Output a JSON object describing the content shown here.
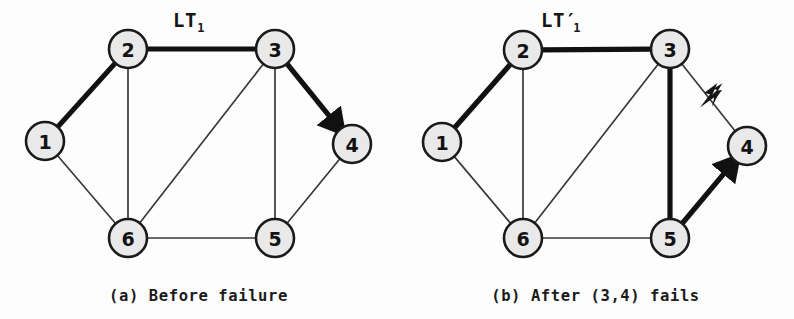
{
  "figure": {
    "background_color": "#fdfdfd",
    "node_fill": "#e9e9e9",
    "node_stroke": "#1a1a1a",
    "edge_thin_color": "#3a3a3a",
    "edge_bold_color": "#111111"
  },
  "panels": [
    {
      "id": "a",
      "caption": "(a) Before failure",
      "tree_label_main": "LT",
      "tree_label_prime": "",
      "tree_label_sub": "1",
      "tree_label_x": 173,
      "tree_label_y": 27,
      "nodes": [
        {
          "id": "1",
          "label": "1",
          "cx": 45,
          "cy": 141,
          "r": 19
        },
        {
          "id": "2",
          "label": "2",
          "cx": 128,
          "cy": 49,
          "r": 19
        },
        {
          "id": "3",
          "label": "3",
          "cx": 275,
          "cy": 49,
          "r": 19
        },
        {
          "id": "4",
          "label": "4",
          "cx": 352,
          "cy": 144,
          "r": 19
        },
        {
          "id": "5",
          "label": "5",
          "cx": 275,
          "cy": 238,
          "r": 19
        },
        {
          "id": "6",
          "label": "6",
          "cx": 128,
          "cy": 238,
          "r": 19
        }
      ],
      "edges": [
        {
          "from": "1",
          "to": "2",
          "weight": "bold",
          "arrow": false
        },
        {
          "from": "2",
          "to": "3",
          "weight": "bold",
          "arrow": false
        },
        {
          "from": "3",
          "to": "4",
          "weight": "bold",
          "arrow": true
        },
        {
          "from": "1",
          "to": "6",
          "weight": "thin",
          "arrow": false
        },
        {
          "from": "2",
          "to": "6",
          "weight": "thin",
          "arrow": false
        },
        {
          "from": "6",
          "to": "3",
          "weight": "thin",
          "arrow": false
        },
        {
          "from": "6",
          "to": "5",
          "weight": "thin",
          "arrow": false
        },
        {
          "from": "3",
          "to": "5",
          "weight": "thin",
          "arrow": false
        },
        {
          "from": "5",
          "to": "4",
          "weight": "thin",
          "arrow": false
        }
      ],
      "failure_marker": null
    },
    {
      "id": "b",
      "caption": "(b) After (3,4) fails",
      "tree_label_main": "LT",
      "tree_label_prime": "′",
      "tree_label_sub": "1",
      "tree_label_x": 144,
      "tree_label_y": 27,
      "nodes": [
        {
          "id": "1",
          "label": "1",
          "cx": 45,
          "cy": 142,
          "r": 19
        },
        {
          "id": "2",
          "label": "2",
          "cx": 126,
          "cy": 50,
          "r": 19
        },
        {
          "id": "3",
          "label": "3",
          "cx": 273,
          "cy": 49,
          "r": 19
        },
        {
          "id": "4",
          "label": "4",
          "cx": 350,
          "cy": 146,
          "r": 19
        },
        {
          "id": "5",
          "label": "5",
          "cx": 273,
          "cy": 238,
          "r": 19
        },
        {
          "id": "6",
          "label": "6",
          "cx": 126,
          "cy": 238,
          "r": 19
        }
      ],
      "edges": [
        {
          "from": "1",
          "to": "2",
          "weight": "bold",
          "arrow": false
        },
        {
          "from": "2",
          "to": "3",
          "weight": "bold",
          "arrow": false
        },
        {
          "from": "3",
          "to": "5",
          "weight": "bold",
          "arrow": false
        },
        {
          "from": "5",
          "to": "4",
          "weight": "bold",
          "arrow": true
        },
        {
          "from": "1",
          "to": "6",
          "weight": "thin",
          "arrow": false
        },
        {
          "from": "2",
          "to": "6",
          "weight": "thin",
          "arrow": false
        },
        {
          "from": "6",
          "to": "3",
          "weight": "thin",
          "arrow": false
        },
        {
          "from": "6",
          "to": "5",
          "weight": "thin",
          "arrow": false
        },
        {
          "from": "3",
          "to": "4",
          "weight": "thin",
          "arrow": false
        }
      ],
      "failure_marker": {
        "on_edge": "3-4",
        "x": 315,
        "y": 97,
        "icon": "lightning-bolt-icon"
      }
    }
  ],
  "chart_data": {
    "type": "diagram",
    "subtitle": "",
    "nodes": [
      "1",
      "2",
      "3",
      "4",
      "5",
      "6"
    ],
    "panels": [
      {
        "name": "(a) Before failure",
        "tree": "LT1",
        "tree_edges": [
          [
            "1",
            "2"
          ],
          [
            "2",
            "3"
          ],
          [
            "3",
            "4"
          ]
        ],
        "background_edges": [
          [
            "1",
            "6"
          ],
          [
            "2",
            "6"
          ],
          [
            "6",
            "3"
          ],
          [
            "6",
            "5"
          ],
          [
            "3",
            "5"
          ],
          [
            "5",
            "4"
          ]
        ],
        "failed_edge": null
      },
      {
        "name": "(b) After (3,4) fails",
        "tree": "LT'1",
        "tree_edges": [
          [
            "1",
            "2"
          ],
          [
            "2",
            "3"
          ],
          [
            "3",
            "5"
          ],
          [
            "5",
            "4"
          ]
        ],
        "background_edges": [
          [
            "1",
            "6"
          ],
          [
            "2",
            "6"
          ],
          [
            "6",
            "3"
          ],
          [
            "6",
            "5"
          ],
          [
            "3",
            "4"
          ]
        ],
        "failed_edge": [
          "3",
          "4"
        ]
      }
    ]
  }
}
